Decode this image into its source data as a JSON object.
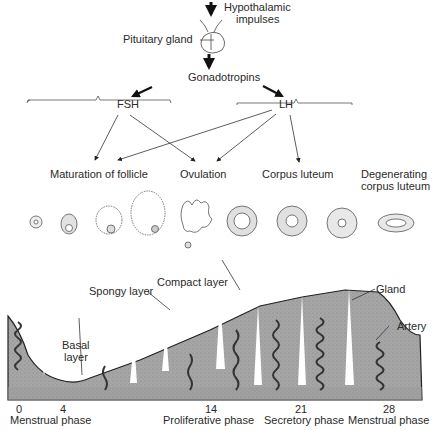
{
  "hormones": {
    "hypothalamic_line1": "Hypothalamic",
    "hypothalamic_line2": "impulses",
    "pituitary": "Pituitary gland",
    "gonadotropins": "Gonadotropins",
    "fsh": "FSH",
    "lh": "LH"
  },
  "ovarian_stages": {
    "maturation": "Maturation of follicle",
    "ovulation": "Ovulation",
    "corpus_luteum": "Corpus luteum",
    "degenerating_line1": "Degenerating",
    "degenerating_line2": "corpus luteum"
  },
  "endometrium": {
    "compact_layer": "Compact layer",
    "spongy_layer": "Spongy layer",
    "basal_line1": "Basal",
    "basal_line2": "layer",
    "gland": "Gland",
    "artery": "Artery"
  },
  "timeline": {
    "days": [
      "0",
      "4",
      "14",
      "21",
      "28"
    ],
    "phases": [
      "Menstrual phase",
      "Proliferative phase",
      "Secretory phase",
      "Menstrual phase"
    ]
  },
  "colors": {
    "tissue": "#a9a9a9",
    "tissue_dark": "#8e8e8e",
    "ink": "#222222"
  }
}
